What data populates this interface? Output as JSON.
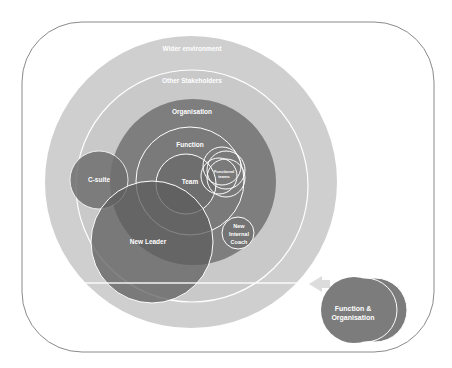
{
  "diagram": {
    "type": "nested-stakeholder-circles",
    "colors": {
      "background": "#ffffff",
      "frame_stroke": "#8a8a8a",
      "wider_environment": "#cfcfcf",
      "other_stakeholders": "#c8c8c8",
      "organisation": "#7e7e7e",
      "function": "#7a7a7a",
      "team": "#6e6e6e",
      "c_suite": "#767676",
      "new_leader": "#6a6a6a",
      "new_internal_coach": "#747474",
      "function_organisation": "#7c7c7c",
      "outline": "#ffffff",
      "arrow": "#dcdcdc"
    },
    "labels": {
      "wider_environment": "Wider environment",
      "other_stakeholders": "Other Stakeholders",
      "organisation": "Organisation",
      "function": "Function",
      "team": "Team",
      "functional_teams_line1": "Functional",
      "functional_teams_line2": "teams",
      "c_suite": "C-suite",
      "new_leader": "New Leader",
      "new_internal_coach_line1": "New",
      "new_internal_coach_line2": "Internal",
      "new_internal_coach_line3": "Coach",
      "function_organisation_line1": "Function &",
      "function_organisation_line2": "Organisation"
    }
  }
}
